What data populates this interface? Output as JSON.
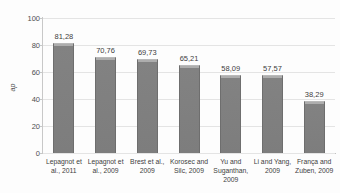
{
  "chart_data": {
    "type": "bar",
    "title": "",
    "xlabel": "",
    "ylabel": "ap",
    "ylim": [
      0,
      100
    ],
    "yticks": [
      0,
      20,
      40,
      60,
      80,
      100
    ],
    "ytick_labels": [
      "0",
      "20",
      "40",
      "60",
      "80",
      "100"
    ],
    "grid": true,
    "legend": false,
    "categories": [
      "Lepagnot et al., 2011",
      "Lepagnot et al., 2009",
      "Brest et al., 2009",
      "Korosec and Silc, 2009",
      "Yu and Suganthan, 2009",
      "Li and Yang, 2009",
      "França and Zuben, 2009"
    ],
    "values": [
      81.28,
      70.76,
      69.73,
      65.21,
      58.09,
      57.57,
      38.29
    ],
    "value_labels": [
      "81,28",
      "70,76",
      "69,73",
      "65,21",
      "58,09",
      "57,57",
      "38,29"
    ],
    "colors": {
      "bar_fill": "#808080",
      "bar_border": "#6e6e6e",
      "gridline": "#e4e4e4",
      "axis": "#c8c8c8",
      "text": "#3d3d3d",
      "background": "#fdfdfd"
    }
  }
}
